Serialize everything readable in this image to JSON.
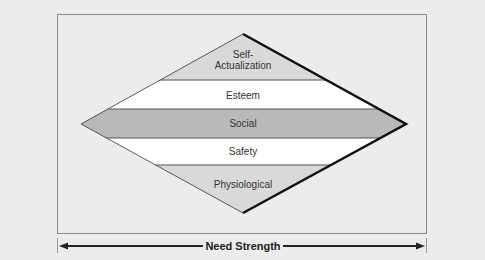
{
  "diagram": {
    "levels": [
      {
        "line1": "Self-",
        "line2": "Actualization",
        "fill": "#d9d9d9"
      },
      {
        "label": "Esteem",
        "fill": "#ffffff"
      },
      {
        "label": "Social",
        "fill": "#b9b9b9"
      },
      {
        "label": "Safety",
        "fill": "#ffffff"
      },
      {
        "label": "Physiological",
        "fill": "#d9d9d9"
      }
    ],
    "axis_label": "Need Strength",
    "colors": {
      "background": "#ececec",
      "frame": "#888888",
      "outline": "#111111"
    }
  }
}
